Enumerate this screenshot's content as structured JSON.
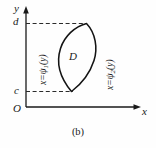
{
  "figure": {
    "caption": "(b)",
    "region_label": "D",
    "axes": {
      "x_label": "x",
      "y_label": "y",
      "origin_label": "O",
      "y_tick_upper": "d",
      "y_tick_lower": "c"
    },
    "curves": [
      {
        "id": "left-boundary",
        "text": "x=ψ",
        "subscript": "1",
        "suffix": "(y)",
        "full": "x=ψ1(y)"
      },
      {
        "id": "right-boundary",
        "text": "x=ψ",
        "subscript": "2",
        "suffix": "(y)",
        "full": "x=ψ2(y)"
      }
    ],
    "colors": {
      "stroke": "#1a1a1a",
      "background": "#fefefe",
      "dashed": "#2b2b2b"
    }
  }
}
